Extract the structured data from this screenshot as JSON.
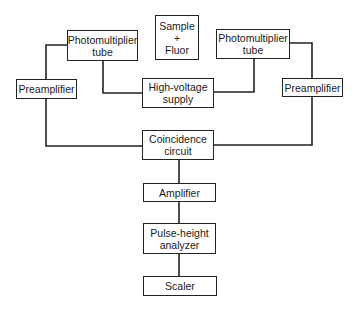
{
  "diagram": {
    "type": "block-diagram",
    "title": "",
    "nodes": {
      "sample": {
        "lines": [
          "Sample",
          "+",
          "Fluor"
        ]
      },
      "pmt_left": {
        "lines": [
          "Photomultiplier",
          "tube"
        ]
      },
      "pmt_right": {
        "lines": [
          "Photomultiplier",
          "tube"
        ]
      },
      "preamp_left": {
        "lines": [
          "Preamplifier"
        ]
      },
      "preamp_right": {
        "lines": [
          "Preamplifier"
        ]
      },
      "hv_supply": {
        "lines": [
          "High-voltage",
          "supply"
        ]
      },
      "coincidence": {
        "lines": [
          "Coincidence",
          "circuit"
        ]
      },
      "amplifier": {
        "lines": [
          "Amplifier"
        ]
      },
      "pha": {
        "lines": [
          "Pulse-height",
          "analyzer"
        ]
      },
      "scaler": {
        "lines": [
          "Scaler"
        ]
      }
    },
    "edges": [
      [
        "pmt_left",
        "preamp_left"
      ],
      [
        "pmt_right",
        "preamp_right"
      ],
      [
        "pmt_left",
        "hv_supply"
      ],
      [
        "pmt_right",
        "hv_supply"
      ],
      [
        "preamp_left",
        "coincidence"
      ],
      [
        "preamp_right",
        "coincidence"
      ],
      [
        "coincidence",
        "amplifier"
      ],
      [
        "amplifier",
        "pha"
      ],
      [
        "pha",
        "scaler"
      ]
    ],
    "line_color": "#222222"
  }
}
